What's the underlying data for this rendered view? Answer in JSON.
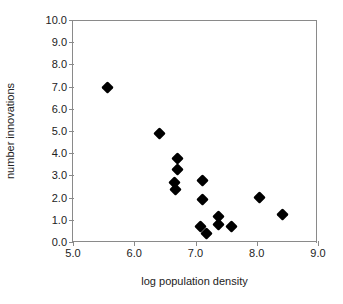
{
  "chart_data": {
    "type": "scatter",
    "title": "",
    "xlabel": "log population density",
    "ylabel": "number innovations",
    "xlim": [
      5.0,
      9.0
    ],
    "ylim": [
      0.0,
      10.0
    ],
    "xticks": [
      "5.0",
      "6.0",
      "7.0",
      "8.0",
      "9.0"
    ],
    "xtick_values": [
      5.0,
      6.0,
      7.0,
      8.0,
      9.0
    ],
    "yticks": [
      "0.0",
      "1.0",
      "2.0",
      "3.0",
      "4.0",
      "5.0",
      "6.0",
      "7.0",
      "8.0",
      "9.0",
      "10.0"
    ],
    "ytick_values": [
      0.0,
      1.0,
      2.0,
      3.0,
      4.0,
      5.0,
      6.0,
      7.0,
      8.0,
      9.0,
      10.0
    ],
    "grid": false,
    "legend": null,
    "marker": "filled-diamond",
    "marker_color": "#000000",
    "points": [
      {
        "x": 5.56,
        "y": 6.95
      },
      {
        "x": 6.41,
        "y": 4.9
      },
      {
        "x": 6.7,
        "y": 3.75
      },
      {
        "x": 6.7,
        "y": 3.28
      },
      {
        "x": 6.65,
        "y": 2.68
      },
      {
        "x": 6.68,
        "y": 2.35
      },
      {
        "x": 7.12,
        "y": 2.75
      },
      {
        "x": 7.12,
        "y": 1.92
      },
      {
        "x": 7.08,
        "y": 0.72
      },
      {
        "x": 7.18,
        "y": 0.38
      },
      {
        "x": 7.38,
        "y": 1.15
      },
      {
        "x": 7.38,
        "y": 0.8
      },
      {
        "x": 7.58,
        "y": 0.72
      },
      {
        "x": 8.05,
        "y": 2.0
      },
      {
        "x": 8.42,
        "y": 1.25
      }
    ]
  }
}
